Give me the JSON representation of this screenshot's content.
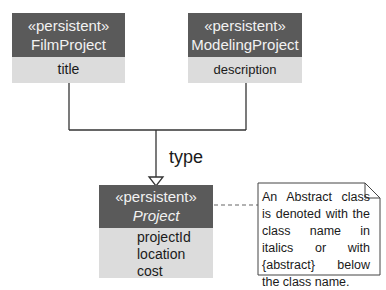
{
  "diagram": {
    "type": "UML class diagram",
    "classes": [
      {
        "id": "film-project",
        "stereotype": "«persistent»",
        "name": "FilmProject",
        "abstract": false,
        "attributes": [
          "title"
        ]
      },
      {
        "id": "modeling-project",
        "stereotype": "«persistent»",
        "name": "ModelingProject",
        "abstract": false,
        "attributes": [
          "description"
        ]
      },
      {
        "id": "project",
        "stereotype": "«persistent»",
        "name": "Project",
        "abstract": true,
        "attributes": [
          "projectId",
          "location",
          "cost"
        ]
      }
    ],
    "relationships": [
      {
        "type": "generalization",
        "from": "FilmProject",
        "to": "Project",
        "label": "type"
      },
      {
        "type": "generalization",
        "from": "ModelingProject",
        "to": "Project",
        "label": "type"
      }
    ],
    "generalization_label": "type",
    "note": {
      "text": "An Abstract class is denoted with the class name in italics or with {abstract} below the class name.",
      "attached_to": "Project"
    },
    "colors": {
      "header": "#5a5a5a",
      "header_text": "#f2f2f2",
      "body": "#dcdcdc",
      "line": "#333333",
      "note_dash": "#999999"
    }
  }
}
